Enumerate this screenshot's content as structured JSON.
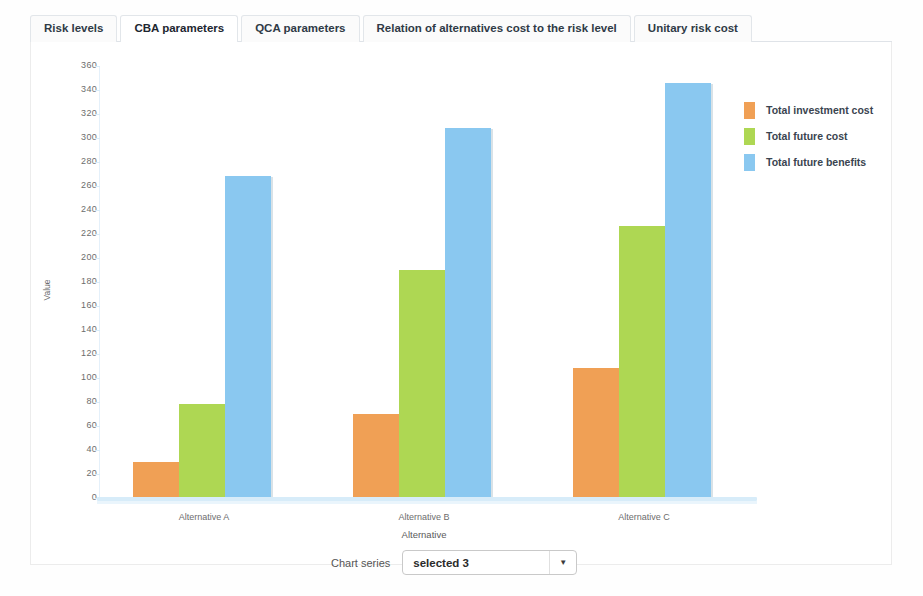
{
  "tabs": [
    {
      "label": "Risk levels",
      "active": false
    },
    {
      "label": "CBA parameters",
      "active": true
    },
    {
      "label": "QCA parameters",
      "active": false
    },
    {
      "label": "Relation of alternatives cost to the risk level",
      "active": false
    },
    {
      "label": "Unitary risk cost",
      "active": false
    }
  ],
  "series_control": {
    "label": "Chart series",
    "selected": "selected 3"
  },
  "colors": {
    "series_investment": "#f0a055",
    "series_future_cost": "#aed753",
    "series_future_benefits": "#8ac8f0",
    "axis": "#d7ecf9",
    "tick_text": "#6d6d6d"
  },
  "chart_data": {
    "type": "bar",
    "title": "",
    "xlabel": "Alternative",
    "ylabel": "Value",
    "categories": [
      "Alternative A",
      "Alternative B",
      "Alternative C"
    ],
    "series": [
      {
        "name": "Total investment cost",
        "color": "#f0a055",
        "values": [
          30,
          70,
          108
        ]
      },
      {
        "name": "Total future cost",
        "color": "#aed753",
        "values": [
          78,
          190,
          227
        ]
      },
      {
        "name": "Total future benefits",
        "color": "#8ac8f0",
        "values": [
          268,
          308,
          346
        ]
      }
    ],
    "ylim": [
      0,
      360
    ],
    "ytick_step": 20,
    "yticks": [
      0,
      20,
      40,
      60,
      80,
      100,
      120,
      140,
      160,
      180,
      200,
      220,
      240,
      260,
      280,
      300,
      320,
      340,
      360
    ],
    "grid": false,
    "legend_position": "right"
  }
}
